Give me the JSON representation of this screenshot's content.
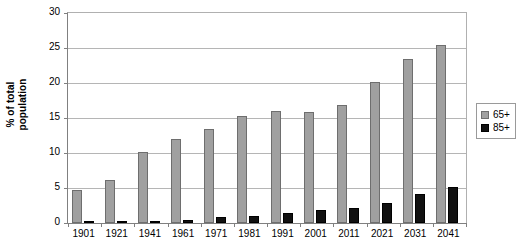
{
  "chart_data": {
    "type": "bar",
    "title": "",
    "xlabel": "",
    "ylabel": "% of total population",
    "ylim": [
      0,
      30
    ],
    "yticks": [
      0,
      5,
      10,
      15,
      20,
      25,
      30
    ],
    "grid": true,
    "legend_position": "right",
    "categories": [
      "1901",
      "1921",
      "1941",
      "1961",
      "1971",
      "1981",
      "1991",
      "2001",
      "2011",
      "2021",
      "2031",
      "2041"
    ],
    "series": [
      {
        "name": "65+",
        "color": "#a0a0a0",
        "values": [
          4.7,
          6.1,
          10.1,
          12.0,
          13.4,
          15.3,
          16.0,
          15.9,
          16.9,
          20.1,
          23.4,
          25.4
        ]
      },
      {
        "name": "85+",
        "color": "#111111",
        "values": [
          0.15,
          0.2,
          0.3,
          0.5,
          0.8,
          1.0,
          1.5,
          1.9,
          2.1,
          2.8,
          4.1,
          5.2
        ]
      }
    ]
  },
  "axis": {
    "y_title_line1": "% of total",
    "y_title_line2": "population"
  }
}
